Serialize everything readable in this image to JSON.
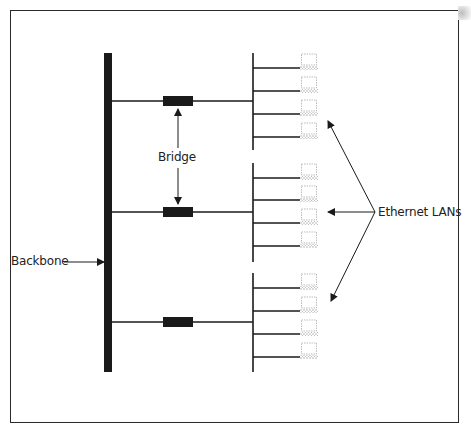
{
  "diagram": {
    "type": "network-topology",
    "labels": {
      "backbone": "Backbone",
      "bridge": "Bridge",
      "ethernet_lans": "Ethernet LANs"
    },
    "colors": {
      "line": "#1a1a1a",
      "frame": "#2a2a2a",
      "computer_outline": "#b5b5b5",
      "background": "#ffffff"
    },
    "backbone": {
      "x": 108,
      "y_top": 53,
      "y_bottom": 372,
      "width": 8
    },
    "bridges": [
      {
        "id": "bridge-1",
        "x": 163,
        "y": 96,
        "w": 30,
        "h": 10,
        "branch_y": 101
      },
      {
        "id": "bridge-2",
        "x": 163,
        "y": 207,
        "w": 30,
        "h": 10,
        "branch_y": 212
      },
      {
        "id": "bridge-3",
        "x": 163,
        "y": 317,
        "w": 30,
        "h": 10,
        "branch_y": 322
      }
    ],
    "lans": [
      {
        "id": "lan-1",
        "bus_x": 253,
        "y_top": 53,
        "y_bottom": 150,
        "stations_y": [
          68,
          91,
          114,
          137
        ]
      },
      {
        "id": "lan-2",
        "bus_x": 253,
        "y_top": 163,
        "y_bottom": 262,
        "stations_y": [
          178,
          200,
          223,
          246
        ]
      },
      {
        "id": "lan-3",
        "bus_x": 253,
        "y_top": 273,
        "y_bottom": 372,
        "stations_y": [
          288,
          311,
          334,
          357
        ]
      }
    ],
    "arrows": {
      "backbone_pointer": {
        "from": [
          64,
          262
        ],
        "to": [
          104,
          262
        ]
      },
      "bridge_up": {
        "from": [
          178,
          148
        ],
        "to": [
          178,
          109
        ]
      },
      "bridge_down": {
        "from": [
          178,
          168
        ],
        "to": [
          178,
          204
        ]
      },
      "lan_pointers": [
        {
          "from": [
            375,
            212
          ],
          "to": [
            328,
            121
          ]
        },
        {
          "from": [
            375,
            212
          ],
          "to": [
            328,
            212
          ]
        },
        {
          "from": [
            375,
            212
          ],
          "to": [
            331,
            301
          ]
        }
      ]
    }
  }
}
